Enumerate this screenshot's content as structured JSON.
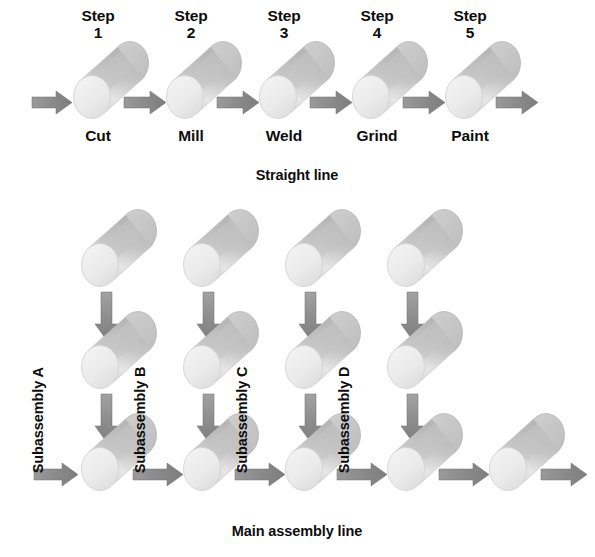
{
  "figure": {
    "title_top": "Straight line",
    "title_bottom": "Main assembly line",
    "background_color": "#ffffff",
    "text_color": "#0d0d0d"
  },
  "palette": {
    "cylinder_face": "#ededed",
    "cylinder_face_edge": "#d6d6d6",
    "cylinder_body_light": "#e3e3e3",
    "cylinder_body_mid": "#c9c9c9",
    "cylinder_body_dark": "#b4b4b4",
    "cylinder_back_cap": "#c2c2c2",
    "arrow_fill": "#8c8c8c",
    "arrow_fill_dark": "#7b7b7b"
  },
  "straight_line": {
    "caption": "Straight line",
    "caption_pos": {
      "x": 297,
      "y": 168
    },
    "steps": [
      {
        "step_label": "Step",
        "step_number": "1",
        "operation": "Cut",
        "cx": 92,
        "cy": 97,
        "step_pos": {
          "x": 98,
          "y": 8
        },
        "op_pos": {
          "x": 98,
          "y": 128
        }
      },
      {
        "step_label": "Step",
        "step_number": "2",
        "operation": "Mill",
        "cx": 185,
        "cy": 97,
        "step_pos": {
          "x": 191,
          "y": 8
        },
        "op_pos": {
          "x": 191,
          "y": 128
        }
      },
      {
        "step_label": "Step",
        "step_number": "3",
        "operation": "Weld",
        "cx": 278,
        "cy": 97,
        "step_pos": {
          "x": 284,
          "y": 8
        },
        "op_pos": {
          "x": 284,
          "y": 128
        }
      },
      {
        "step_label": "Step",
        "step_number": "4",
        "operation": "Grind",
        "cx": 371,
        "cy": 97,
        "step_pos": {
          "x": 377,
          "y": 8
        },
        "op_pos": {
          "x": 377,
          "y": 128
        }
      },
      {
        "step_label": "Step",
        "step_number": "5",
        "operation": "Paint",
        "cx": 464,
        "cy": 97,
        "step_pos": {
          "x": 470,
          "y": 8
        },
        "op_pos": {
          "x": 470,
          "y": 128
        }
      }
    ],
    "arrows": [
      {
        "name": "inflow-arrow",
        "x": 32,
        "y": 91,
        "length": 40,
        "dir": "right"
      },
      {
        "name": "arrow-step1-step2",
        "x": 124,
        "y": 91,
        "length": 42,
        "dir": "right"
      },
      {
        "name": "arrow-step2-step3",
        "x": 217,
        "y": 91,
        "length": 42,
        "dir": "right"
      },
      {
        "name": "arrow-step3-step4",
        "x": 310,
        "y": 91,
        "length": 42,
        "dir": "right"
      },
      {
        "name": "arrow-step4-step5",
        "x": 403,
        "y": 91,
        "length": 42,
        "dir": "right"
      },
      {
        "name": "outflow-arrow",
        "x": 496,
        "y": 91,
        "length": 42,
        "dir": "right"
      }
    ]
  },
  "assembly_network": {
    "caption": "Main assembly line",
    "caption_pos": {
      "x": 297,
      "y": 524
    },
    "subassemblies": [
      {
        "label": "Subassembly A",
        "label_pos": {
          "x": 46,
          "y": 458
        },
        "column_cx": 100,
        "cylinders": [
          {
            "cx": 100,
            "cy": 265
          },
          {
            "cx": 100,
            "cy": 367
          },
          {
            "cx": 100,
            "cy": 469
          }
        ],
        "down_arrows": [
          {
            "x": 95,
            "y": 292,
            "length": 48
          },
          {
            "x": 95,
            "y": 394,
            "length": 48
          }
        ]
      },
      {
        "label": "Subassembly B",
        "label_pos": {
          "x": 148,
          "y": 458
        },
        "column_cx": 202,
        "cylinders": [
          {
            "cx": 202,
            "cy": 265
          },
          {
            "cx": 202,
            "cy": 367
          },
          {
            "cx": 202,
            "cy": 469
          }
        ],
        "down_arrows": [
          {
            "x": 197,
            "y": 292,
            "length": 48
          },
          {
            "x": 197,
            "y": 394,
            "length": 48
          }
        ]
      },
      {
        "label": "Subassembly C",
        "label_pos": {
          "x": 250,
          "y": 458
        },
        "column_cx": 304,
        "cylinders": [
          {
            "cx": 304,
            "cy": 265
          },
          {
            "cx": 304,
            "cy": 367
          },
          {
            "cx": 304,
            "cy": 469
          }
        ],
        "down_arrows": [
          {
            "x": 299,
            "y": 292,
            "length": 48
          },
          {
            "x": 299,
            "y": 394,
            "length": 48
          }
        ]
      },
      {
        "label": "Subassembly D",
        "label_pos": {
          "x": 352,
          "y": 458
        },
        "column_cx": 406,
        "cylinders": [
          {
            "cx": 406,
            "cy": 265
          },
          {
            "cx": 406,
            "cy": 367
          },
          {
            "cx": 406,
            "cy": 469
          }
        ],
        "down_arrows": [
          {
            "x": 401,
            "y": 292,
            "length": 48
          },
          {
            "x": 401,
            "y": 394,
            "length": 48
          }
        ]
      }
    ],
    "main_line_cylinders": [
      {
        "cx": 100,
        "cy": 469
      },
      {
        "cx": 202,
        "cy": 469
      },
      {
        "cx": 304,
        "cy": 469
      },
      {
        "cx": 406,
        "cy": 469
      },
      {
        "cx": 508,
        "cy": 469
      }
    ],
    "main_line_arrows": [
      {
        "name": "main-inflow-arrow",
        "x": 34,
        "y": 463,
        "length": 44,
        "dir": "right"
      },
      {
        "name": "main-arrow-a-b",
        "x": 133,
        "y": 463,
        "length": 50,
        "dir": "right"
      },
      {
        "name": "main-arrow-b-c",
        "x": 235,
        "y": 463,
        "length": 50,
        "dir": "right"
      },
      {
        "name": "main-arrow-c-d",
        "x": 337,
        "y": 463,
        "length": 50,
        "dir": "right"
      },
      {
        "name": "main-arrow-d-final",
        "x": 439,
        "y": 463,
        "length": 50,
        "dir": "right"
      },
      {
        "name": "main-outflow-arrow",
        "x": 541,
        "y": 463,
        "length": 46,
        "dir": "right"
      }
    ]
  }
}
